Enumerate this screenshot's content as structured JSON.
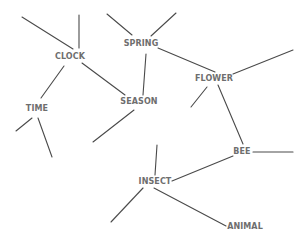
{
  "diagram": {
    "type": "semantic-network",
    "colors": {
      "background": "#ffffff",
      "edge": "#4a4a4a",
      "label": "#6e6e6e"
    },
    "nodes": [
      {
        "id": "clock",
        "label": "CLOCK",
        "x": 70,
        "y": 57
      },
      {
        "id": "spring",
        "label": "SPRING",
        "x": 141,
        "y": 44
      },
      {
        "id": "flower",
        "label": "FLOWER",
        "x": 214,
        "y": 79
      },
      {
        "id": "time",
        "label": "TIME",
        "x": 37,
        "y": 109
      },
      {
        "id": "season",
        "label": "SEASON",
        "x": 139,
        "y": 102
      },
      {
        "id": "bee",
        "label": "BEE",
        "x": 242,
        "y": 152
      },
      {
        "id": "insect",
        "label": "INSECT",
        "x": 155,
        "y": 182
      },
      {
        "id": "animal",
        "label": "ANIMAL",
        "x": 245,
        "y": 227
      }
    ],
    "edges": [
      {
        "from": "clock",
        "to": null,
        "x1": 22,
        "y1": 17,
        "x2": 73,
        "y2": 49
      },
      {
        "from": "clock",
        "to": null,
        "x1": 79,
        "y1": 15,
        "x2": 79,
        "y2": 48
      },
      {
        "from": "clock",
        "to": "time",
        "x1": 64,
        "y1": 66,
        "x2": 41,
        "y2": 98
      },
      {
        "from": "clock",
        "to": "season",
        "x1": 82,
        "y1": 63,
        "x2": 125,
        "y2": 95
      },
      {
        "from": "spring",
        "to": null,
        "x1": 107,
        "y1": 14,
        "x2": 132,
        "y2": 35
      },
      {
        "from": "spring",
        "to": null,
        "x1": 176,
        "y1": 13,
        "x2": 151,
        "y2": 36
      },
      {
        "from": "spring",
        "to": "season",
        "x1": 146,
        "y1": 54,
        "x2": 143,
        "y2": 95
      },
      {
        "from": "spring",
        "to": "flower",
        "x1": 158,
        "y1": 48,
        "x2": 215,
        "y2": 72
      },
      {
        "from": "flower",
        "to": null,
        "x1": 233,
        "y1": 74,
        "x2": 293,
        "y2": 50
      },
      {
        "from": "flower",
        "to": null,
        "x1": 207,
        "y1": 87,
        "x2": 191,
        "y2": 107
      },
      {
        "from": "flower",
        "to": "bee",
        "x1": 218,
        "y1": 85,
        "x2": 243,
        "y2": 144
      },
      {
        "from": "time",
        "to": null,
        "x1": 32,
        "y1": 118,
        "x2": 16,
        "y2": 131
      },
      {
        "from": "time",
        "to": null,
        "x1": 38,
        "y1": 118,
        "x2": 52,
        "y2": 157
      },
      {
        "from": "season",
        "to": null,
        "x1": 134,
        "y1": 110,
        "x2": 93,
        "y2": 142
      },
      {
        "from": "bee",
        "to": null,
        "x1": 253,
        "y1": 152,
        "x2": 293,
        "y2": 152
      },
      {
        "from": "bee",
        "to": "insect",
        "x1": 233,
        "y1": 156,
        "x2": 172,
        "y2": 181
      },
      {
        "from": "insect",
        "to": null,
        "x1": 157,
        "y1": 145,
        "x2": 155,
        "y2": 175
      },
      {
        "from": "insect",
        "to": "animal",
        "x1": 154,
        "y1": 188,
        "x2": 226,
        "y2": 226
      },
      {
        "from": "insect",
        "to": null,
        "x1": 143,
        "y1": 188,
        "x2": 111,
        "y2": 222
      }
    ]
  }
}
